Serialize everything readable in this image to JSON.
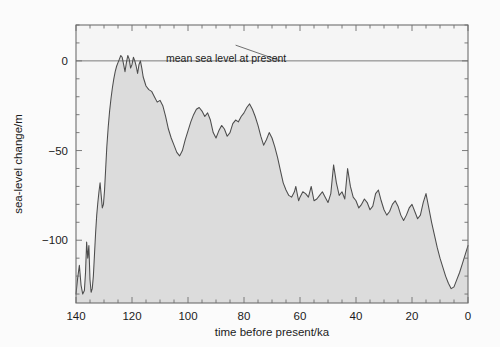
{
  "figure": {
    "name": "sea-level-change-over-time",
    "background_color": "#fbfbfb",
    "plot_background_color": "#f5f5f5",
    "fill_color": "#dcdcdc",
    "line_color": "#4d4d4d",
    "frame_color": "#6e6e6e",
    "text_color": "#1b1b1b"
  },
  "chart_data": {
    "type": "area",
    "title": "",
    "xlabel": "time before present/ka",
    "ylabel": "sea-level change/m",
    "xlim": [
      140,
      0
    ],
    "ylim": [
      -135,
      20
    ],
    "x_reversed": true,
    "grid": false,
    "legend": "none",
    "xticks": [
      140,
      120,
      100,
      80,
      60,
      40,
      20,
      0
    ],
    "xtick_labels": [
      "140",
      "120",
      "100",
      "80",
      "60",
      "40",
      "20",
      "0"
    ],
    "x_minor_tick_step": 5,
    "yticks": [
      0,
      -50,
      -100
    ],
    "ytick_labels": [
      "0",
      "−50",
      "−100"
    ],
    "y_minor_tick_step": 10,
    "annotations": [
      {
        "text": "mean sea level at present",
        "x": 83,
        "y": 11,
        "leader_to_x": 67,
        "leader_to_y": 0
      }
    ],
    "reference_line": {
      "name": "mean-sea-level",
      "y": 0,
      "from_x": 140,
      "to_x": 0
    },
    "series": [
      {
        "name": "sea-level change",
        "units": "m",
        "x": [
          140.0,
          139.4,
          138.8,
          138.2,
          137.6,
          137.0,
          136.6,
          136.2,
          135.8,
          135.4,
          135.0,
          134.6,
          134.2,
          133.8,
          133.4,
          133.0,
          132.6,
          132.2,
          131.8,
          131.4,
          131.0,
          130.6,
          130.2,
          129.8,
          129.4,
          129.0,
          128.5,
          128.0,
          127.5,
          127.0,
          126.5,
          126.0,
          125.5,
          125.0,
          124.5,
          124.0,
          123.5,
          123.0,
          122.5,
          122.0,
          121.5,
          121.0,
          120.5,
          120.0,
          119.5,
          119.0,
          118.5,
          118.0,
          117.5,
          117.0,
          116.5,
          116.0,
          115.0,
          114.0,
          113.0,
          112.0,
          111.0,
          110.0,
          109.0,
          108.0,
          107.0,
          106.0,
          105.0,
          104.0,
          103.0,
          102.0,
          101.0,
          100.0,
          99.0,
          98.0,
          97.0,
          96.0,
          95.0,
          94.0,
          93.0,
          92.0,
          91.0,
          90.0,
          89.0,
          88.0,
          87.0,
          86.0,
          85.0,
          84.0,
          83.0,
          82.0,
          81.0,
          80.0,
          79.0,
          78.0,
          77.0,
          76.0,
          75.0,
          74.0,
          73.0,
          72.0,
          71.0,
          70.0,
          69.0,
          68.0,
          67.0,
          66.0,
          65.0,
          64.0,
          63.0,
          62.0,
          61.5,
          61.0,
          60.5,
          60.0,
          59.0,
          58.0,
          57.0,
          56.5,
          56.0,
          55.5,
          55.0,
          54.0,
          53.0,
          52.0,
          51.0,
          50.0,
          49.0,
          48.0,
          47.0,
          46.0,
          45.0,
          44.0,
          43.0,
          42.0,
          41.0,
          40.0,
          39.0,
          38.0,
          37.0,
          36.0,
          35.0,
          34.0,
          33.0,
          32.0,
          31.0,
          30.0,
          29.0,
          28.0,
          27.0,
          26.0,
          25.0,
          24.0,
          23.0,
          22.0,
          21.0,
          20.0,
          19.0,
          18.0,
          17.0,
          16.0,
          15.0,
          14.0,
          13.0,
          12.0,
          11.0,
          10.0,
          9.0,
          8.0,
          7.0,
          6.0,
          5.0,
          4.0,
          3.0,
          2.0,
          1.0,
          0.0
        ],
        "y": [
          -130,
          -121,
          -114,
          -125,
          -130,
          -128,
          -118,
          -101,
          -110,
          -103,
          -122,
          -129,
          -127,
          -120,
          -108,
          -96,
          -86,
          -79,
          -73,
          -68,
          -75,
          -82,
          -80,
          -72,
          -60,
          -48,
          -37,
          -28,
          -21,
          -15,
          -10,
          -6,
          -3,
          -1,
          1,
          3,
          2,
          -2,
          -6,
          -1,
          3,
          1,
          -4,
          -2,
          2,
          0,
          -3,
          -7,
          -2,
          0,
          -4,
          -9,
          -14,
          -16,
          -17,
          -20,
          -23,
          -22,
          -25,
          -31,
          -38,
          -43,
          -47,
          -51,
          -53,
          -50,
          -44,
          -39,
          -34,
          -30,
          -27,
          -26,
          -28,
          -31,
          -29,
          -33,
          -40,
          -43,
          -39,
          -36,
          -38,
          -42,
          -40,
          -35,
          -33,
          -34,
          -31,
          -29,
          -26,
          -24,
          -27,
          -31,
          -36,
          -42,
          -47,
          -44,
          -40,
          -43,
          -48,
          -54,
          -61,
          -68,
          -72,
          -75,
          -76,
          -73,
          -70,
          -74,
          -78,
          -76,
          -73,
          -74,
          -76,
          -73,
          -70,
          -74,
          -78,
          -77,
          -75,
          -73,
          -76,
          -79,
          -74,
          -58,
          -68,
          -75,
          -73,
          -77,
          -60,
          -70,
          -76,
          -78,
          -82,
          -80,
          -77,
          -79,
          -83,
          -81,
          -74,
          -72,
          -78,
          -83,
          -86,
          -84,
          -80,
          -78,
          -81,
          -86,
          -89,
          -86,
          -82,
          -80,
          -84,
          -88,
          -86,
          -79,
          -74,
          -82,
          -90,
          -97,
          -104,
          -110,
          -115,
          -120,
          -124,
          -127,
          -126,
          -122,
          -118,
          -113,
          -108,
          -103
        ],
        "note": "Glacial–interglacial sea-level curve: highstand near present at 125 ka, lowstand near −130 m at Last Glacial Maximum (~20 ka), rapid rise to present."
      }
    ]
  }
}
